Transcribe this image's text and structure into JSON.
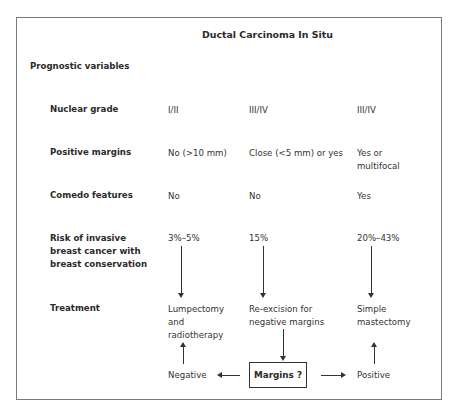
{
  "title": "Ductal Carcinoma In Situ",
  "section_heading": "Prognostic variables",
  "rows": [
    {
      "label": "Nuclear grade",
      "values": [
        "I/II",
        "III/IV",
        "III/IV"
      ]
    },
    {
      "label": "Positive margins",
      "values": [
        "No (>10 mm)",
        "Close (<5 mm) or yes",
        "Yes or\nmultifocal"
      ]
    },
    {
      "label": "Comedo features",
      "values": [
        "No",
        "No",
        "Yes"
      ]
    },
    {
      "label": "Risk of invasive breast cancer with breast conservation",
      "values": [
        "3%–5%",
        "15%",
        "20%–43%"
      ]
    },
    {
      "label": "Treatment",
      "values": [
        "Lumpectomy and radiotherapy",
        "Re-excision for negative margins",
        "Simple mastectomy"
      ]
    }
  ],
  "labels": {
    "nuclear_grade": "Nuclear grade",
    "positive_margins": "Positive margins",
    "comedo": "Comedo features",
    "risk_l1": "Risk of invasive",
    "risk_l2": "breast cancer with",
    "risk_l3": "breast conservation",
    "treatment": "Treatment"
  },
  "cells": {
    "ng1": "I/II",
    "ng2": "III/IV",
    "ng3": "III/IV",
    "pm1": "No (>10 mm)",
    "pm2": "Close (<5 mm) or yes",
    "pm3_l1": "Yes or",
    "pm3_l2": "multifocal",
    "cf1": "No",
    "cf2": "No",
    "cf3": "Yes",
    "r1": "3%–5%",
    "r2": "15%",
    "r3": "20%–43%",
    "t1_l1": "Lumpectomy",
    "t1_l2": "and",
    "t1_l3": "radiotherapy",
    "t2_l1": "Re-excision for",
    "t2_l2": "negative margins",
    "t3_l1": "Simple",
    "t3_l2": "mastectomy"
  },
  "decision": {
    "box_label": "Margins ?",
    "negative": "Negative",
    "positive": "Positive"
  }
}
